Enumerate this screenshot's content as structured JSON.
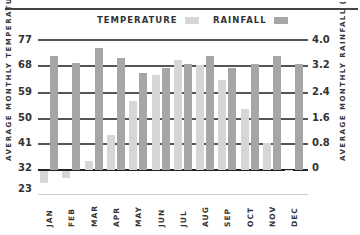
{
  "legend": {
    "temperature_label": "TEMPERATURE",
    "rainfall_label": "RAINFALL"
  },
  "axes": {
    "left_label": "AVERAGE MONTHLY TEMPERATURE (°F)",
    "right_label": "AVERAGE MONTHLY RAINFALL (in)",
    "left_ticks": [
      "77",
      "68",
      "59",
      "50",
      "41",
      "32",
      "23"
    ],
    "right_ticks": [
      "4.0",
      "3.2",
      "2.4",
      "1.6",
      "0.8",
      "0"
    ]
  },
  "colors": {
    "temperature": "#d6d6d6",
    "rainfall": "#a6a6a6",
    "grid": "#555555"
  },
  "chart_data": {
    "type": "bar",
    "title": "",
    "categories": [
      "JAN",
      "FEB",
      "MAR",
      "APR",
      "MAY",
      "JUN",
      "JUL",
      "AUG",
      "SEP",
      "OCT",
      "NOV",
      "DEC"
    ],
    "series": [
      {
        "name": "TEMPERATURE",
        "axis": "left",
        "unit": "°F",
        "values": [
          28,
          29.5,
          35,
          44,
          56,
          65,
          70,
          68.5,
          63,
          53,
          41.5,
          32
        ]
      },
      {
        "name": "RAINFALL",
        "axis": "right",
        "unit": "in",
        "values": [
          3.5,
          3.3,
          3.75,
          3.45,
          3.0,
          3.15,
          3.25,
          3.5,
          3.15,
          3.25,
          3.5,
          3.25
        ]
      }
    ],
    "xlabel": "",
    "ylabel": "AVERAGE MONTHLY TEMPERATURE (°F)",
    "y2label": "AVERAGE MONTHLY RAINFALL (in)",
    "ylim": [
      23,
      77
    ],
    "y2lim": [
      0,
      4.0
    ],
    "baseline_temperature": 32,
    "grid": true,
    "legend_position": "top"
  }
}
